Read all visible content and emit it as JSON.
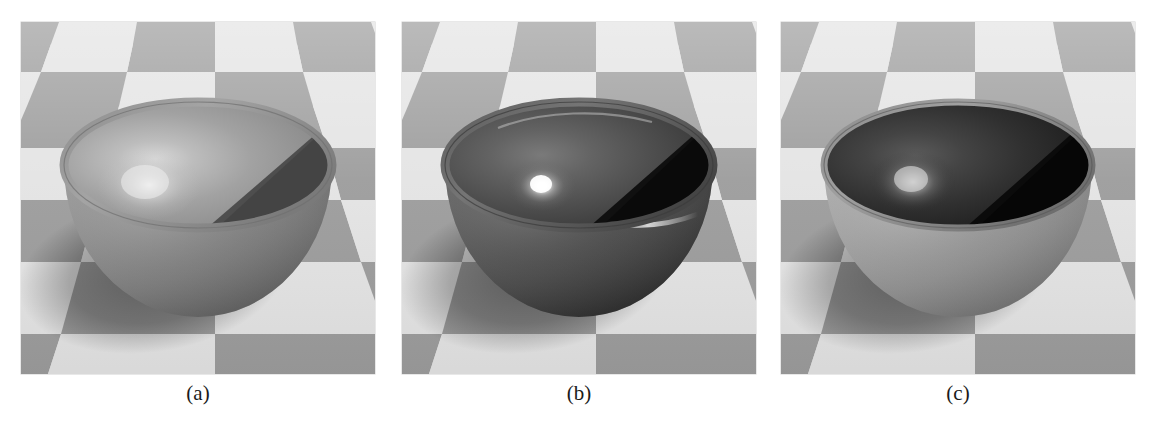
{
  "figure": {
    "background_color": "#ffffff",
    "panel_count": 3
  },
  "panels": [
    {
      "id": "a",
      "caption": "(a)",
      "scene": "bowl-on-checkerboard",
      "material": "diffuse-matte",
      "highlight": "broad-soft",
      "colors": {
        "floor_light": "#e4e4e4",
        "floor_dark": "#9d9d9d",
        "bowl_outer": "#8a8a8a",
        "bowl_inner_lit": "#a8a8a8",
        "bowl_inner_shadow": "#4a4a4a",
        "rim": "#9e9e9e",
        "highlight": "#e8e8e8",
        "cast_shadow": "#6e6e6e"
      }
    },
    {
      "id": "b",
      "caption": "(b)",
      "scene": "bowl-on-checkerboard",
      "material": "glossy-specular",
      "highlight": "tight-bright",
      "colors": {
        "floor_light": "#e4e4e4",
        "floor_dark": "#9d9d9d",
        "bowl_outer": "#5b5b5b",
        "bowl_inner_lit": "#5e5e5e",
        "bowl_inner_shadow": "#1c1c1c",
        "rim": "#6a6a6a",
        "highlight": "#ffffff",
        "cast_shadow": "#6e6e6e"
      }
    },
    {
      "id": "c",
      "caption": "(c)",
      "scene": "bowl-on-checkerboard",
      "material": "dark-interior-bright-exterior",
      "highlight": "medium-soft",
      "colors": {
        "floor_light": "#e4e4e4",
        "floor_dark": "#9d9d9d",
        "bowl_outer": "#9a9a9a",
        "bowl_inner_lit": "#3a3a3a",
        "bowl_inner_shadow": "#121212",
        "rim": "#8f8f8f",
        "highlight": "#d6d6d6",
        "cast_shadow": "#6e6e6e"
      }
    }
  ]
}
